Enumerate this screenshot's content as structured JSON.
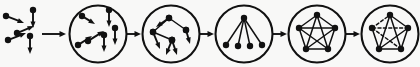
{
  "figure": {
    "type": "process-flow",
    "stage_count": 5,
    "background_color": "#f8f8f7",
    "ink_color": "#111111",
    "canvas": {
      "width": 420,
      "height": 67
    }
  },
  "connectors": {
    "style": "solid-line-with-filled-arrowhead",
    "color": "#111111",
    "count": 5,
    "segments": [
      {
        "name": "seed-to-stage-1",
        "x1": 42,
        "x2": 66,
        "y": 34
      },
      {
        "name": "stage-1-to-stage-2",
        "x1": 127,
        "x2": 141,
        "y": 34
      },
      {
        "name": "stage-2-to-stage-3",
        "x1": 200,
        "x2": 214,
        "y": 34
      },
      {
        "name": "stage-3-to-stage-4",
        "x1": 273,
        "x2": 287,
        "y": 34
      },
      {
        "name": "stage-4-to-stage-5",
        "x1": 346,
        "x2": 360,
        "y": 34
      }
    ]
  },
  "seed_cluster": {
    "name": "scattered-agents",
    "description": "loose cluster of directed agents with velocity vectors, no circle boundary",
    "arrow_count": 5,
    "arrows": [
      {
        "x1": 6,
        "y1": 16,
        "x2": 24,
        "y2": 23
      },
      {
        "x1": 8,
        "y1": 40,
        "x2": 26,
        "y2": 33
      },
      {
        "x1": 17,
        "y1": 33,
        "x2": 34,
        "y2": 26
      },
      {
        "x1": 33,
        "y1": 10,
        "x2": 33,
        "y2": 28
      },
      {
        "x1": 30,
        "y1": 36,
        "x2": 30,
        "y2": 54
      }
    ]
  },
  "stages": [
    {
      "index": 1,
      "name": "stage-dispersed",
      "label": "dispersed agents",
      "cx": 98,
      "cy": 34,
      "r": 28.5,
      "content_type": "vectors",
      "nodes": [],
      "edges": [],
      "arrows": [
        {
          "x1": 82,
          "y1": 16,
          "x2": 95,
          "y2": 24
        },
        {
          "x1": 109,
          "y1": 10,
          "x2": 109,
          "y2": 27
        },
        {
          "x1": 78,
          "y1": 45,
          "x2": 92,
          "y2": 36
        },
        {
          "x1": 88,
          "y1": 41,
          "x2": 104,
          "y2": 31
        },
        {
          "x1": 104,
          "y1": 35,
          "x2": 104,
          "y2": 52
        },
        {
          "x1": 115,
          "y1": 28,
          "x2": 115,
          "y2": 45
        }
      ]
    },
    {
      "index": 2,
      "name": "stage-aggregating",
      "label": "aggregating agents",
      "cx": 171,
      "cy": 34,
      "r": 28.5,
      "content_type": "vectors-and-links",
      "nodes": [
        {
          "id": "a",
          "x": 153,
          "y": 32
        },
        {
          "id": "b",
          "x": 169,
          "y": 18
        },
        {
          "id": "c",
          "x": 186,
          "y": 30
        },
        {
          "id": "d",
          "x": 172,
          "y": 40
        }
      ],
      "edges": [
        {
          "from": "a",
          "to": "b"
        },
        {
          "from": "b",
          "to": "c"
        },
        {
          "from": "a",
          "to": "d"
        }
      ],
      "arrows": [
        {
          "x1": 169,
          "y1": 18,
          "x2": 156,
          "y2": 27
        },
        {
          "x1": 186,
          "y1": 30,
          "x2": 190,
          "y2": 44
        },
        {
          "x1": 172,
          "y1": 40,
          "x2": 166,
          "y2": 55
        },
        {
          "x1": 172,
          "y1": 40,
          "x2": 177,
          "y2": 55
        },
        {
          "x1": 153,
          "y1": 32,
          "x2": 160,
          "y2": 49
        }
      ]
    },
    {
      "index": 3,
      "name": "stage-star-tree",
      "label": "star / hub-and-spoke tree",
      "cx": 244,
      "cy": 34,
      "r": 28.5,
      "content_type": "graph",
      "nodes": [
        {
          "id": "hub",
          "x": 244,
          "y": 18
        },
        {
          "id": "l1",
          "x": 226,
          "y": 45
        },
        {
          "id": "l2",
          "x": 238,
          "y": 46
        },
        {
          "id": "l3",
          "x": 250,
          "y": 46
        },
        {
          "id": "l4",
          "x": 262,
          "y": 45
        }
      ],
      "edges": [
        {
          "from": "hub",
          "to": "l1"
        },
        {
          "from": "hub",
          "to": "l2"
        },
        {
          "from": "hub",
          "to": "l3"
        },
        {
          "from": "hub",
          "to": "l4"
        }
      ],
      "arrows": []
    },
    {
      "index": 4,
      "name": "stage-complete-graph",
      "label": "densely connected pentagon",
      "cx": 317,
      "cy": 34,
      "r": 28.5,
      "content_type": "graph",
      "nodes": [
        {
          "id": "p1",
          "x": 317,
          "y": 15
        },
        {
          "id": "p2",
          "x": 335,
          "y": 28
        },
        {
          "id": "p3",
          "x": 328,
          "y": 49
        },
        {
          "id": "p4",
          "x": 306,
          "y": 49
        },
        {
          "id": "p5",
          "x": 299,
          "y": 28
        }
      ],
      "edges": [
        {
          "from": "p1",
          "to": "p2"
        },
        {
          "from": "p2",
          "to": "p3"
        },
        {
          "from": "p3",
          "to": "p4"
        },
        {
          "from": "p4",
          "to": "p5"
        },
        {
          "from": "p5",
          "to": "p1"
        },
        {
          "from": "p1",
          "to": "p3"
        },
        {
          "from": "p1",
          "to": "p4"
        },
        {
          "from": "p2",
          "to": "p4"
        },
        {
          "from": "p2",
          "to": "p5"
        },
        {
          "from": "p3",
          "to": "p5"
        }
      ],
      "arrows": []
    },
    {
      "index": 5,
      "name": "stage-pruned-graph",
      "label": "pentagon with weakened links",
      "cx": 390,
      "cy": 34,
      "r": 28.5,
      "content_type": "graph",
      "nodes": [
        {
          "id": "q1",
          "x": 390,
          "y": 15
        },
        {
          "id": "q2",
          "x": 408,
          "y": 28
        },
        {
          "id": "q3",
          "x": 401,
          "y": 49
        },
        {
          "id": "q4",
          "x": 379,
          "y": 49
        },
        {
          "id": "q5",
          "x": 372,
          "y": 28
        }
      ],
      "edges": [
        {
          "from": "q1",
          "to": "q2",
          "style": "solid"
        },
        {
          "from": "q2",
          "to": "q3",
          "style": "solid"
        },
        {
          "from": "q3",
          "to": "q4",
          "style": "solid"
        },
        {
          "from": "q4",
          "to": "q5",
          "style": "solid"
        },
        {
          "from": "q5",
          "to": "q1",
          "style": "dashed"
        },
        {
          "from": "q1",
          "to": "q3",
          "style": "solid"
        },
        {
          "from": "q1",
          "to": "q4",
          "style": "solid"
        },
        {
          "from": "q2",
          "to": "q4",
          "style": "solid"
        },
        {
          "from": "q2",
          "to": "q5",
          "style": "dashed"
        },
        {
          "from": "q3",
          "to": "q5",
          "style": "dashed"
        }
      ],
      "arrows": []
    }
  ],
  "style_tokens": {
    "circle_stroke_width": 2.1,
    "edge_stroke_width": 1.5,
    "dashed_pattern": "3 2.4",
    "node_radius": 3.2,
    "arrow_shaft_width": 1.9,
    "arrowhead_length": 6.5,
    "arrowhead_width": 5
  }
}
